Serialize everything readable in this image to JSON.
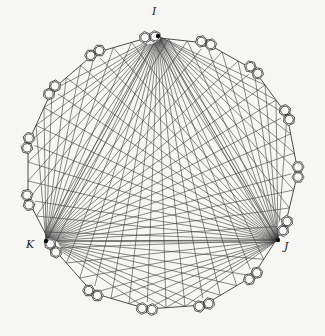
{
  "diagram": {
    "type": "graph",
    "hubs": [
      {
        "id": "I",
        "label": "I",
        "x": 158,
        "y": 36,
        "label_x": 152,
        "label_y": 9
      },
      {
        "id": "J",
        "label": "J",
        "x": 278,
        "y": 240,
        "label_x": 284,
        "label_y": 244
      },
      {
        "id": "K",
        "label": "K",
        "x": 46,
        "y": 241,
        "label_x": 27,
        "label_y": 242
      }
    ],
    "gadgets": [
      {
        "x": 150,
        "y": 37
      },
      {
        "x": 206,
        "y": 43
      },
      {
        "x": 254,
        "y": 70
      },
      {
        "x": 287,
        "y": 115
      },
      {
        "x": 298,
        "y": 172
      },
      {
        "x": 285,
        "y": 226
      },
      {
        "x": 253,
        "y": 276
      },
      {
        "x": 204,
        "y": 305
      },
      {
        "x": 147,
        "y": 309
      },
      {
        "x": 93,
        "y": 293
      },
      {
        "x": 53,
        "y": 248
      },
      {
        "x": 28,
        "y": 200
      },
      {
        "x": 28,
        "y": 143
      },
      {
        "x": 52,
        "y": 90
      },
      {
        "x": 95,
        "y": 53
      }
    ],
    "colors": {
      "line": "#3a3a3a",
      "background": "#f6f6f4",
      "label": "#222222"
    }
  }
}
